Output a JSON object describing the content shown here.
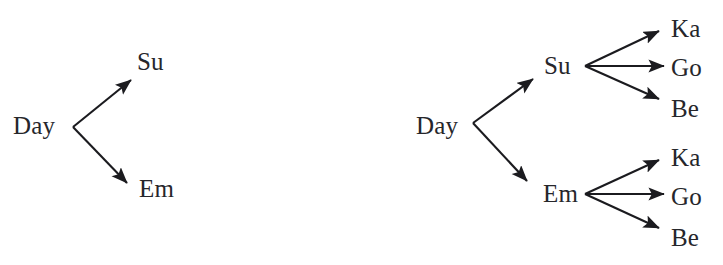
{
  "figure": {
    "background_color": "#ffffff",
    "text_color": "#26262b",
    "edge_color": "#1b1b1f"
  },
  "diagrams": [
    {
      "name": "two-level-tree",
      "nodes": {
        "root": "Day",
        "level1": [
          "Su",
          "Em"
        ]
      }
    },
    {
      "name": "three-level-tree",
      "nodes": {
        "root": "Day",
        "level1": [
          "Su",
          "Em"
        ],
        "level2_from_su": [
          "Ka",
          "Go",
          "Be"
        ],
        "level2_from_em": [
          "Ka",
          "Go",
          "Be"
        ]
      }
    }
  ],
  "labels": {
    "left_day": "Day",
    "left_su": "Su",
    "left_em": "Em",
    "right_day": "Day",
    "right_su": "Su",
    "right_em": "Em",
    "right_su_ka": "Ka",
    "right_su_go": "Go",
    "right_su_be": "Be",
    "right_em_ka": "Ka",
    "right_em_go": "Go",
    "right_em_be": "Be"
  }
}
